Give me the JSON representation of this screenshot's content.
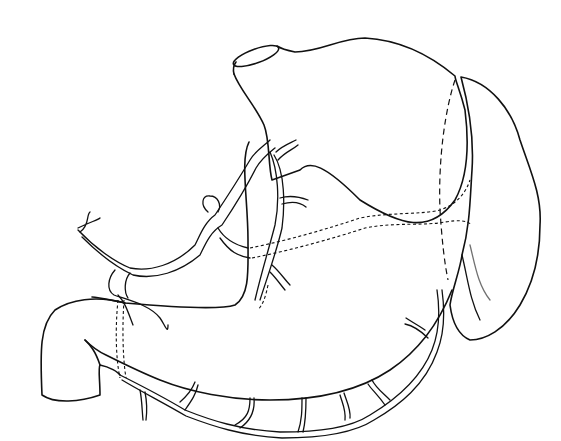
{
  "figure": {
    "type": "anatomical line illustration",
    "labels": [],
    "colors": {
      "line": "#111111",
      "background": "#ffffff",
      "stipple": "#222222"
    }
  },
  "parts": [
    {
      "id": "stomach",
      "name": "Stomach outline"
    },
    {
      "id": "esophagus",
      "name": "Esophageal opening (cardia)"
    },
    {
      "id": "duodenum",
      "name": "Duodenum"
    },
    {
      "id": "spleen",
      "name": "Spleen (stippled)"
    },
    {
      "id": "celiac-trunk",
      "name": "Celiac trunk branches"
    },
    {
      "id": "lesser-curvature-vessels",
      "name": "Vessels along lesser curvature"
    },
    {
      "id": "greater-curvature-vessels",
      "name": "Gastroepiploic arcade along greater curvature"
    },
    {
      "id": "posterior-vessels",
      "name": "Dashed posterior vessels"
    }
  ]
}
